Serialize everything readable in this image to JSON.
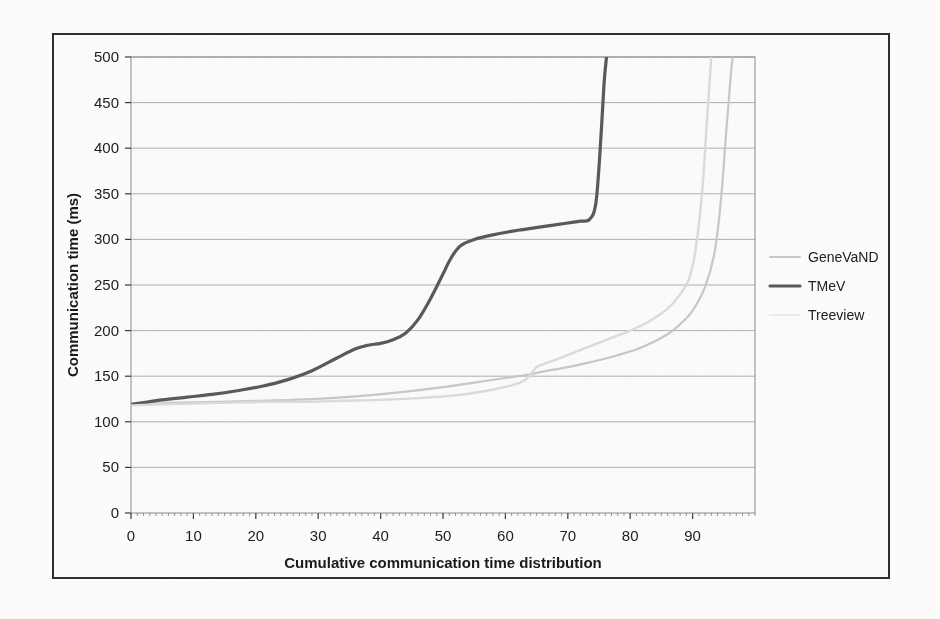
{
  "figure": {
    "border_color": "#2e2e2e",
    "background": "#fdfdfc"
  },
  "chart_data": {
    "type": "line",
    "title": "",
    "xlabel": "Cumulative communication time distribution",
    "ylabel": "Communication time (ms)",
    "xlim": [
      0,
      100
    ],
    "ylim": [
      0,
      500
    ],
    "xticks": [
      0,
      10,
      20,
      30,
      40,
      50,
      60,
      70,
      80,
      90
    ],
    "yticks": [
      0,
      50,
      100,
      150,
      200,
      250,
      300,
      350,
      400,
      450,
      500
    ],
    "grid": "horizontal",
    "legend_position": "right",
    "series": [
      {
        "name": "GeneVaND",
        "color": "#c9c9c9",
        "width": 2.2,
        "x": [
          0,
          3,
          8,
          14,
          20,
          26,
          32,
          38,
          44,
          50,
          55,
          60,
          63,
          66,
          70,
          74,
          78,
          82,
          86,
          88,
          90,
          92,
          93.5,
          94.5,
          95.3,
          96,
          96.4
        ],
        "y": [
          119,
          120,
          121,
          122,
          123,
          124,
          126,
          129,
          133,
          138,
          143,
          148,
          151,
          155,
          160,
          166,
          173,
          182,
          196,
          207,
          222,
          248,
          285,
          340,
          410,
          470,
          500
        ]
      },
      {
        "name": "TMeV",
        "color": "#5a5a5a",
        "width": 3.2,
        "x": [
          0,
          2,
          5,
          9,
          13,
          17,
          21,
          25,
          29,
          33,
          36,
          38,
          40,
          42,
          44,
          46,
          48,
          50,
          51,
          52,
          53,
          55,
          58,
          62,
          66,
          70,
          72,
          73.5,
          74.5,
          75.2,
          75.8,
          76.2
        ],
        "y": [
          119,
          121,
          124,
          127,
          130,
          134,
          139,
          146,
          156,
          170,
          180,
          184,
          186,
          190,
          197,
          212,
          235,
          262,
          276,
          287,
          294,
          300,
          305,
          310,
          314,
          318,
          320,
          322,
          340,
          400,
          470,
          500
        ]
      },
      {
        "name": "Treeview",
        "color": "#dcdcdc",
        "width": 2.4,
        "x": [
          0,
          4,
          10,
          16,
          22,
          28,
          34,
          40,
          46,
          52,
          57,
          61,
          63,
          64,
          65,
          66,
          68,
          71,
          74,
          77,
          80,
          83,
          86,
          88,
          89.5,
          90.5,
          91.5,
          92.3,
          93
        ],
        "y": [
          118,
          119,
          120,
          121,
          122,
          122,
          123,
          124,
          126,
          129,
          134,
          140,
          145,
          152,
          160,
          163,
          168,
          176,
          184,
          192,
          200,
          210,
          224,
          240,
          258,
          290,
          350,
          430,
          500
        ]
      }
    ]
  },
  "legend": {
    "items": [
      {
        "label": "GeneVaND",
        "color": "#c9c9c9",
        "has_swatch": true
      },
      {
        "label": "TMeV",
        "color": "#5a5a5a",
        "has_swatch": true
      },
      {
        "label": "Treeview",
        "color": "#ededed",
        "has_swatch": true
      }
    ]
  },
  "axis": {
    "x_tick_labels": [
      "0",
      "10",
      "20",
      "30",
      "40",
      "50",
      "60",
      "70",
      "80",
      "90"
    ],
    "y_tick_labels": [
      "0",
      "50",
      "100",
      "150",
      "200",
      "250",
      "300",
      "350",
      "400",
      "450",
      "500"
    ],
    "x_title": "Cumulative communication time distribution",
    "y_title": "Communication time (ms)"
  }
}
